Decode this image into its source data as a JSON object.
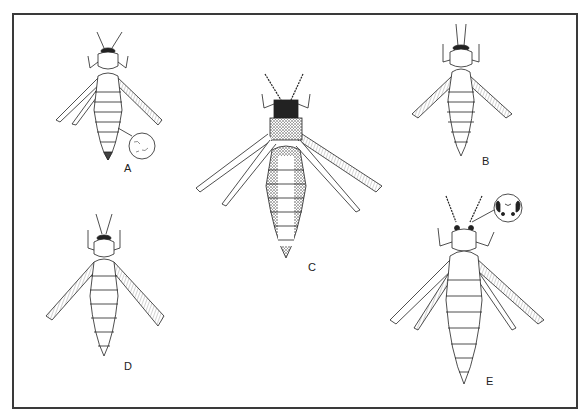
{
  "figure": {
    "type": "scientific-illustration",
    "line_color": "#222222",
    "border_color": "#3a3a3a",
    "background": "#ffffff",
    "panels": [
      {
        "label": "A",
        "inset": "circular magnified detail of abdominal tergite",
        "wings": "narrow, fringed right wing"
      },
      {
        "label": "B",
        "inset": null,
        "wings": "fringed, dark fringe"
      },
      {
        "label": "C",
        "inset": null,
        "wings": "broad fringed right wing, stippled dark body"
      },
      {
        "label": "D",
        "inset": null,
        "wings": "heavily fringed both sides"
      },
      {
        "label": "E",
        "inset": "circular magnified detail of head/ocelli",
        "wings": "long fringed wings"
      }
    ]
  }
}
